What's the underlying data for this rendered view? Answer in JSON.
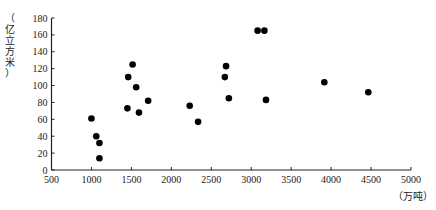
{
  "chart_data": {
    "type": "scatter",
    "title": "",
    "xlabel": "（万吨）",
    "ylabel": "（亿立方米）",
    "xlim": [
      500,
      5000
    ],
    "ylim": [
      0,
      180
    ],
    "xticks": [
      500,
      1000,
      1500,
      2000,
      2500,
      3000,
      3500,
      4000,
      4500,
      5000
    ],
    "yticks": [
      0,
      20,
      40,
      60,
      80,
      100,
      120,
      140,
      160,
      180
    ],
    "grid": false,
    "legend": null,
    "points": [
      {
        "x": 1000,
        "y": 61
      },
      {
        "x": 1060,
        "y": 40
      },
      {
        "x": 1100,
        "y": 32
      },
      {
        "x": 1100,
        "y": 14
      },
      {
        "x": 1450,
        "y": 73
      },
      {
        "x": 1460,
        "y": 110
      },
      {
        "x": 1515,
        "y": 125
      },
      {
        "x": 1560,
        "y": 98
      },
      {
        "x": 1595,
        "y": 68
      },
      {
        "x": 1710,
        "y": 82
      },
      {
        "x": 2230,
        "y": 76
      },
      {
        "x": 2335,
        "y": 57
      },
      {
        "x": 2670,
        "y": 110
      },
      {
        "x": 2685,
        "y": 123
      },
      {
        "x": 2720,
        "y": 85
      },
      {
        "x": 3080,
        "y": 165
      },
      {
        "x": 3165,
        "y": 165
      },
      {
        "x": 3185,
        "y": 83
      },
      {
        "x": 3915,
        "y": 104
      },
      {
        "x": 4465,
        "y": 92
      }
    ]
  },
  "ylabel_chars": [
    "（",
    "亿",
    "立",
    "方",
    "米",
    "）"
  ],
  "style": {
    "point_color": "#000000",
    "axis_color": "#222222"
  }
}
